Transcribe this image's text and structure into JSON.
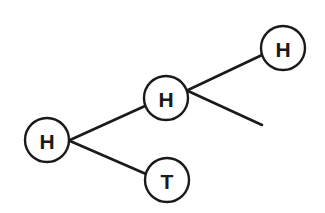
{
  "diagram": {
    "type": "tree",
    "colors": {
      "stroke": "#1a1a1a",
      "background": "#ffffff",
      "text": "#1a1a1a"
    },
    "nodes": [
      {
        "id": "root",
        "label": "H",
        "cx": 47,
        "cy": 140,
        "r": 22
      },
      {
        "id": "mid-h",
        "label": "H",
        "cx": 166,
        "cy": 98,
        "r": 22
      },
      {
        "id": "top-h",
        "label": "H",
        "cx": 283,
        "cy": 48,
        "r": 22
      },
      {
        "id": "bottom-t",
        "label": "T",
        "cx": 167,
        "cy": 180,
        "r": 22
      }
    ],
    "edges": [
      {
        "from": "root",
        "to": "mid-h",
        "x1": 70,
        "y1": 140,
        "x2": 145,
        "y2": 106
      },
      {
        "from": "root",
        "to": "bottom-t",
        "x1": 70,
        "y1": 141,
        "x2": 146,
        "y2": 174
      },
      {
        "from": "mid-h",
        "to": "top-h",
        "x1": 188,
        "y1": 90,
        "x2": 262,
        "y2": 55
      },
      {
        "from": "mid-h",
        "to": "(unlabeled)",
        "x1": 188,
        "y1": 91,
        "x2": 262,
        "y2": 125
      }
    ]
  }
}
